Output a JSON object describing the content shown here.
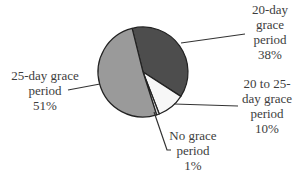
{
  "chart_data": {
    "type": "pie",
    "title": "",
    "slices": [
      {
        "label": "20-day grace period",
        "value": 38,
        "display": "38%",
        "color": "#4d4d4d"
      },
      {
        "label": "20 to 25-day grace period",
        "value": 10,
        "display": "10%",
        "color": "#f7f7f7"
      },
      {
        "label": "No grace period",
        "value": 1,
        "display": "1%",
        "color": "#d9d9d9"
      },
      {
        "label": "25-day grace period",
        "value": 51,
        "display": "51%",
        "color": "#9a9a9a"
      }
    ],
    "start_angle_deg": -14,
    "direction": "clockwise",
    "legend": "none (leader-line labels)"
  },
  "labels": {
    "twenty_day": {
      "line1": "20-day",
      "line2": "grace",
      "line3": "period",
      "pct": "38%"
    },
    "twenty_to_25": {
      "line1": "20 to 25-",
      "line2": "day grace",
      "line3": "period",
      "pct": "10%"
    },
    "no_grace": {
      "line1": "No grace",
      "line2": "period",
      "pct": "1%"
    },
    "twenty_five": {
      "line1": "25-day grace",
      "line2": "period",
      "pct": "51%"
    }
  }
}
